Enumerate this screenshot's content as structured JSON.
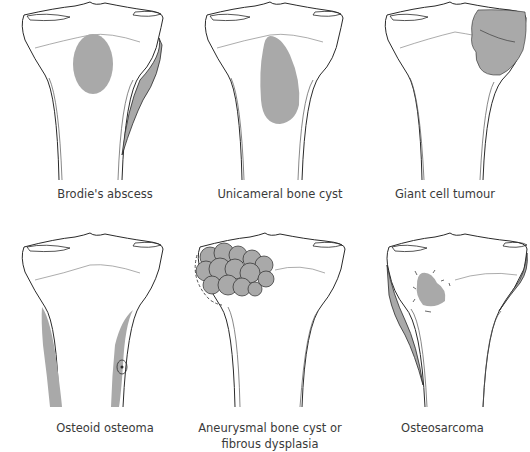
{
  "figure": {
    "side_text": "",
    "fill_color": "#a9a9a9",
    "stroke_color": "#2a2a2a",
    "panels": [
      {
        "id": "brodies-abscess",
        "caption": "Brodie's abscess"
      },
      {
        "id": "unicameral-bone-cyst",
        "caption": "Unicameral bone cyst"
      },
      {
        "id": "giant-cell-tumour",
        "caption": "Giant cell tumour"
      },
      {
        "id": "osteoid-osteoma",
        "caption": "Osteoid osteoma"
      },
      {
        "id": "aneurysmal-bone-cyst",
        "caption_line1": "Aneurysmal bone cyst or",
        "caption_line2": "fibrous dysplasia"
      },
      {
        "id": "osteosarcoma",
        "caption": "Osteosarcoma"
      }
    ]
  }
}
